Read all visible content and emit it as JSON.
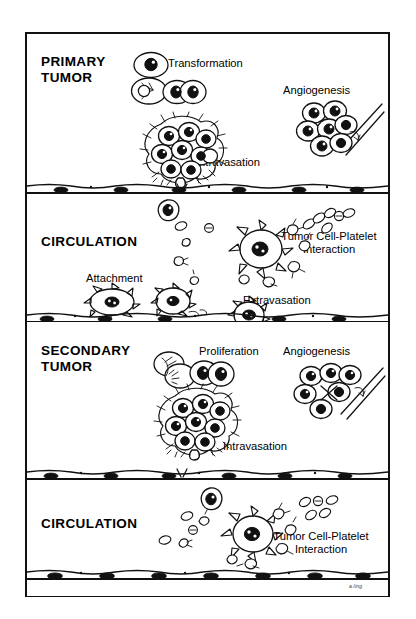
{
  "figure": {
    "type": "metastatic-cascade-schematic",
    "style": "black-and-white line drawing",
    "signature": "a.ling",
    "bands": [
      {
        "id": "primary-tumor",
        "kind": "tissue",
        "heading": "PRIMARY\nTUMOR",
        "labels": [
          {
            "id": "transformation",
            "text": "Transformation"
          },
          {
            "id": "angiogenesis",
            "text": "Angiogenesis"
          },
          {
            "id": "intravasation",
            "text": "Intravasation"
          }
        ]
      },
      {
        "id": "circulation-upper",
        "kind": "vessel",
        "heading": "CIRCULATION",
        "labels": [
          {
            "id": "tumor-cell-platelet",
            "text": "Tumor Cell-Platelet\nInteraction"
          },
          {
            "id": "attachment",
            "text": "Attachment"
          },
          {
            "id": "extravasation",
            "text": "Extravasation"
          }
        ]
      },
      {
        "id": "secondary-tumor",
        "kind": "tissue",
        "heading": "SECONDARY\nTUMOR",
        "labels": [
          {
            "id": "proliferation",
            "text": "Proliferation"
          },
          {
            "id": "angiogenesis",
            "text": "Angiogenesis"
          },
          {
            "id": "intravasation",
            "text": "Intravasation"
          }
        ]
      },
      {
        "id": "circulation-lower",
        "kind": "vessel",
        "heading": "CIRCULATION",
        "labels": [
          {
            "id": "tumor-cell-platelet",
            "text": "Tumor Cell-Platelet\nInteraction"
          }
        ]
      }
    ],
    "colors": {
      "ink": "#111111",
      "background": "#ffffff"
    }
  }
}
